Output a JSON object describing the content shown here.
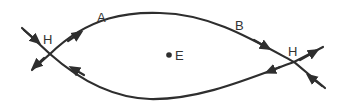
{
  "diagram": {
    "labels": {
      "A": "A",
      "B": "B",
      "H_left": "H",
      "H_right": "H",
      "E": "E"
    },
    "colors": {
      "stroke": "#2e2e2e",
      "text": "#333333",
      "background": "#ffffff"
    }
  }
}
